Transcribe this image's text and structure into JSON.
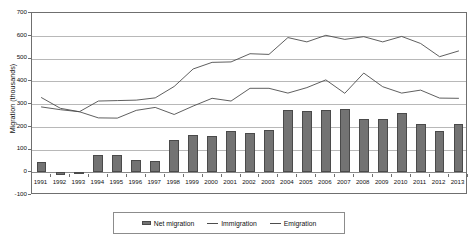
{
  "chart_data": {
    "type": "bar",
    "title": "",
    "subtitle": "",
    "xlabel": "",
    "ylabel": "Migration (thousands)",
    "ylim": [
      -100,
      700
    ],
    "ytick_step": 100,
    "yticks": [
      700,
      600,
      500,
      400,
      300,
      200,
      100,
      0,
      -100
    ],
    "ytick_labels": [
      "700",
      "600",
      "500",
      "400",
      "300",
      "200",
      "100",
      "0",
      "-100"
    ],
    "grid": true,
    "legend_position": "bottom",
    "categories": [
      "1991",
      "1992",
      "1993",
      "1994",
      "1995",
      "1996",
      "1997",
      "1998",
      "1999",
      "2000",
      "2001",
      "2002",
      "2003",
      "2004",
      "2005",
      "2006",
      "2007",
      "2008",
      "2009",
      "2010",
      "2011",
      "2012",
      "2013"
    ],
    "series": [
      {
        "name": "Net migration",
        "kind": "bar",
        "color": "#737373",
        "values": [
          45,
          -13,
          3,
          78,
          78,
          55,
          48,
          140,
          163,
          158,
          180,
          172,
          187,
          273,
          270,
          272,
          280,
          235,
          235,
          262,
          212,
          183,
          213
        ]
      },
      {
        "name": "Immigration",
        "kind": "line",
        "color": "#4d4d4d",
        "values": [
          287,
          275,
          266,
          239,
          238,
          272,
          285,
          254,
          291,
          325,
          313,
          369,
          369,
          348,
          372,
          406,
          347,
          436,
          376,
          348,
          361,
          326,
          325
        ]
      },
      {
        "name": "Emigration",
        "kind": "line",
        "color": "#4d4d4d",
        "values": [
          328,
          281,
          266,
          313,
          315,
          317,
          327,
          377,
          454,
          483,
          485,
          521,
          518,
          592,
          573,
          602,
          584,
          596,
          573,
          597,
          566,
          508,
          533
        ]
      }
    ]
  },
  "legend": {
    "items": [
      {
        "label": "Net migration",
        "marker": "bar-swatch"
      },
      {
        "label": "Immigration",
        "marker": "line-swatch"
      },
      {
        "label": "Emigration",
        "marker": "line-swatch"
      }
    ]
  }
}
